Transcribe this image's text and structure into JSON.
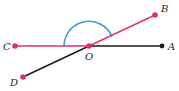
{
  "diagram": {
    "type": "geometry-angles",
    "colors": {
      "red": "#d8336b",
      "black": "#1a1a1a",
      "arc": "#3a9fd0"
    },
    "points": {
      "O": {
        "label": "O",
        "x": 89,
        "y": 46
      },
      "A": {
        "label": "A",
        "x": 162,
        "y": 46
      },
      "B": {
        "label": "B",
        "x": 155,
        "y": 15
      },
      "C": {
        "label": "C",
        "x": 15,
        "y": 46
      },
      "D": {
        "label": "D",
        "x": 23,
        "y": 77
      }
    },
    "segments": [
      {
        "from": "C",
        "to": "O",
        "color": "red"
      },
      {
        "from": "O",
        "to": "B",
        "color": "red"
      },
      {
        "from": "O",
        "to": "A",
        "color": "black"
      },
      {
        "from": "O",
        "to": "D",
        "color": "black"
      }
    ],
    "arc": {
      "label": "angle BOC",
      "center": "O",
      "radius": 25
    }
  }
}
